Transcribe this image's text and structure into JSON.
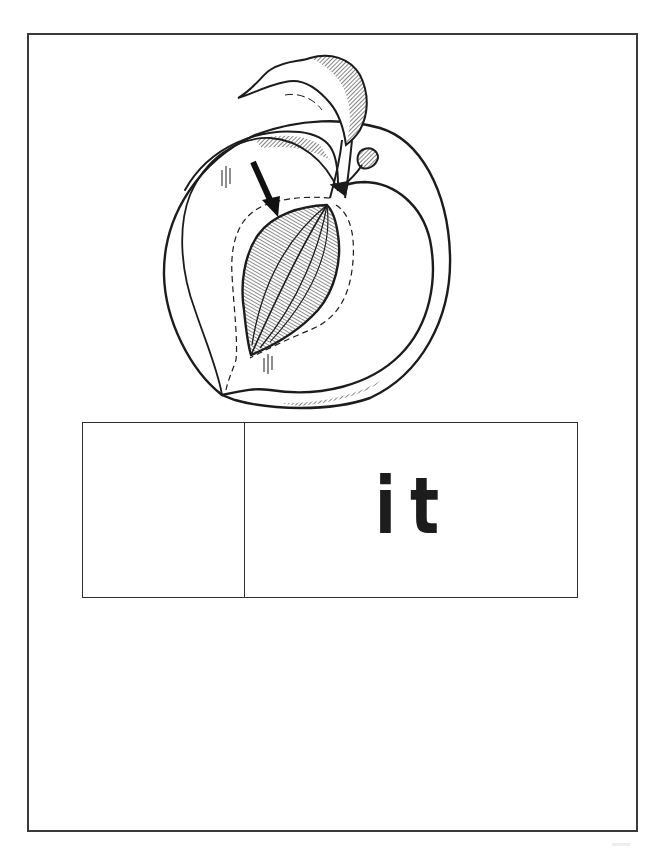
{
  "worksheet": {
    "illustration": {
      "subject": "peach cut in half showing pit",
      "icon": "peach-with-pit-illustration",
      "pointer": "arrow-pointing-to-pit"
    },
    "answer_box": {
      "blank_cell_value": "",
      "word_ending": "it"
    }
  },
  "colors": {
    "ink": "#1c1c1c",
    "border": "#3a3a3a",
    "paper": "#ffffff"
  }
}
